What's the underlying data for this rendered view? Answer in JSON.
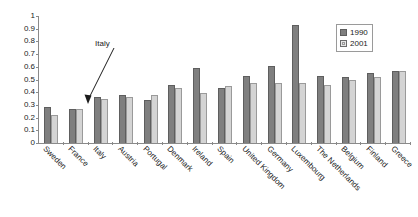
{
  "chart_data": {
    "type": "bar",
    "title": "",
    "xlabel": "",
    "ylabel": "",
    "ylim": [
      0,
      1
    ],
    "grid": false,
    "legend_position": "top-right",
    "categories": [
      "Sweden",
      "France",
      "Italy",
      "Austria",
      "Portugal",
      "Denmark",
      "Ireland",
      "Spain",
      "United Kingdom",
      "Germany",
      "Luxembourg",
      "The Netherlands",
      "Belgium",
      "Finland",
      "Greece"
    ],
    "series": [
      {
        "name": "1990",
        "color": "#7f7f7f",
        "values": [
          0.28,
          0.27,
          0.36,
          0.38,
          0.34,
          0.46,
          0.59,
          0.43,
          0.53,
          0.61,
          0.93,
          0.53,
          0.52,
          0.55,
          0.57
        ]
      },
      {
        "name": "2001",
        "color": "#d4d4d4",
        "values": [
          0.22,
          0.27,
          0.35,
          0.36,
          0.38,
          0.43,
          0.39,
          0.45,
          0.47,
          0.47,
          0.47,
          0.46,
          0.5,
          0.52,
          0.57
        ]
      }
    ],
    "yticks": [
      "0",
      "0.1",
      "0.2",
      "0.3",
      "0.4",
      "0.5",
      "0.6",
      "0.7",
      "0.8",
      "0.9",
      "1"
    ],
    "ytick_values": [
      0,
      0.1,
      0.2,
      0.3,
      0.4,
      0.5,
      0.6,
      0.7,
      0.8,
      0.9,
      1
    ],
    "annotations": [
      {
        "text": "Italy",
        "target_category": "Italy"
      }
    ]
  },
  "legend": {
    "entries": [
      {
        "label": "1990"
      },
      {
        "label": "2001"
      }
    ]
  },
  "colors": {
    "series_1990": "#7f7f7f",
    "series_2001": "#d4d4d4",
    "axis": "#8a8a8a",
    "text": "#1b1b1b",
    "background": "#ffffff"
  }
}
